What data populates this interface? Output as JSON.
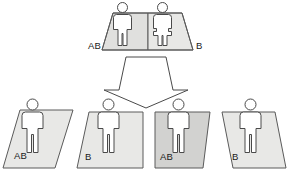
{
  "diagram": {
    "parents": {
      "group_name": "parents",
      "platform_label_left": "AB",
      "platform_label_right": "B",
      "figures": [
        {
          "name": "parent-figure-male",
          "type": "male",
          "blood_type": "AB"
        },
        {
          "name": "parent-figure-female",
          "type": "female",
          "blood_type": "B"
        }
      ]
    },
    "arrow": {
      "name": "inheritance-arrow",
      "direction": "down"
    },
    "offspring": [
      {
        "name": "offspring-1",
        "label": "AB",
        "type": "male",
        "platform_shape": "parallelogram-right",
        "shade": "light"
      },
      {
        "name": "offspring-2",
        "label": "B",
        "type": "male",
        "platform_shape": "quad-lean-left",
        "shade": "light"
      },
      {
        "name": "offspring-3",
        "label": "AB",
        "type": "male",
        "platform_shape": "trapezoid-right",
        "shade": "dark"
      },
      {
        "name": "offspring-4",
        "label": "B",
        "type": "male",
        "platform_shape": "parallelogram-left",
        "shade": "light"
      }
    ],
    "colors": {
      "platform_light": "#e8e8e6",
      "platform_mid": "#e0e0de",
      "platform_dark": "#d2d2d0",
      "outline": "#5a5a5a",
      "figure_fill": "#ffffff",
      "text": "#1a1a1a",
      "background": "#ffffff"
    }
  }
}
